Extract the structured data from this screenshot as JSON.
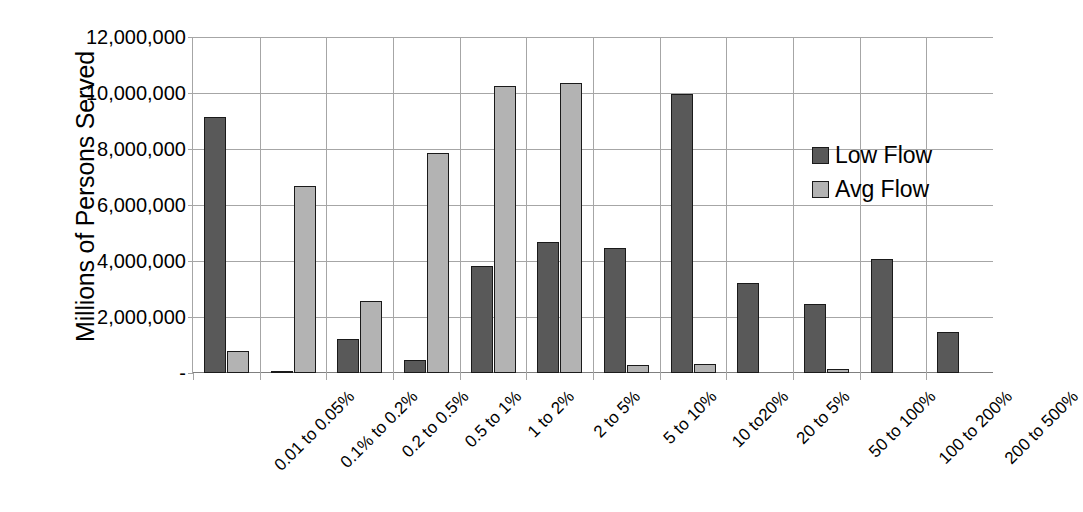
{
  "chart_data": {
    "type": "bar",
    "title": "",
    "xlabel": "",
    "ylabel": "Millions of Persons Served",
    "ylim": [
      0,
      12000000
    ],
    "ytick_values": [
      0,
      2000000,
      4000000,
      6000000,
      8000000,
      10000000,
      12000000
    ],
    "ytick_labels": [
      "-",
      "2,000,000",
      "4,000,000",
      "6,000,000",
      "8,000,000",
      "10,000,000",
      "12,000,000"
    ],
    "grid": true,
    "legend_position": "right",
    "categories": [
      "0.01 to 0.05%",
      "0.1% to 0.2%",
      "0.2 to 0.5%",
      "0.5 to 1%",
      "1 to 2%",
      "2 to 5%",
      "5 to 10%",
      "10 to20%",
      "20 to 5%",
      "50 to 100%",
      "100 to 200%",
      "200 to 500%"
    ],
    "series": [
      {
        "name": "Low Flow",
        "color": "#595959",
        "values": [
          9150000,
          60000,
          1200000,
          480000,
          3820000,
          4680000,
          4480000,
          9950000,
          3230000,
          2480000,
          4060000,
          1450000
        ]
      },
      {
        "name": "Avg Flow",
        "color": "#b3b3b3",
        "values": [
          800000,
          6670000,
          2560000,
          7870000,
          10250000,
          10350000,
          290000,
          330000,
          0,
          140000,
          0,
          0
        ]
      }
    ]
  },
  "legend": {
    "entries": [
      {
        "label": "Low Flow",
        "swatch": "low"
      },
      {
        "label": "Avg Flow",
        "swatch": "avg"
      }
    ]
  },
  "colors": {
    "low_flow": "#595959",
    "avg_flow": "#b3b3b3",
    "gridline": "#a6a6a6",
    "bar_outline": "#1a1a1a",
    "text": "#000000",
    "background": "#ffffff"
  }
}
